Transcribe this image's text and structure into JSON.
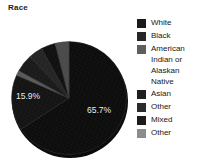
{
  "chart_data": {
    "type": "pie",
    "title": "Race",
    "categories": [
      "White",
      "Black",
      "American Indian or Alaskan Native",
      "Asian",
      "Other",
      "Mixed",
      "Other"
    ],
    "values": [
      65.7,
      15.9,
      null,
      null,
      null,
      null,
      null
    ],
    "visible_labels": [
      "65.7%",
      "15.9%"
    ],
    "legend_position": "right",
    "grid": false,
    "xlabel": "",
    "ylabel": ""
  },
  "header": {
    "title": "Race"
  },
  "pie": {
    "labels": {
      "white": "65.7%",
      "black": "15.9%"
    },
    "slices": [
      {
        "name": "White",
        "pct": 65.7,
        "color": "#0d0d0d"
      },
      {
        "name": "Black",
        "pct": 15.9,
        "color": "#141414"
      },
      {
        "name": "American Indian or Alaskan Native",
        "pct": 1.5,
        "color": "#5a5a5a"
      },
      {
        "name": "Asian",
        "pct": 5.0,
        "color": "#1a1a1a"
      },
      {
        "name": "Other",
        "pct": 4.0,
        "color": "#242424"
      },
      {
        "name": "Mixed",
        "pct": 4.0,
        "color": "#101010"
      },
      {
        "name": "Other2",
        "pct": 3.9,
        "color": "#4a4a4a"
      }
    ]
  },
  "legend": {
    "items": [
      {
        "label": "White",
        "color": "#1a1a1a"
      },
      {
        "label": "Black",
        "color": "#262626"
      },
      {
        "label": "American\nIndian or\nAlaskan\nNative",
        "color": "#5e5e5e"
      },
      {
        "label": "Asian",
        "color": "#1f1f1f"
      },
      {
        "label": "Other",
        "color": "#2b2b2b"
      },
      {
        "label": "Mixed",
        "color": "#1c1c1c"
      },
      {
        "label": "Other",
        "color": "#8c8c8c"
      }
    ]
  }
}
